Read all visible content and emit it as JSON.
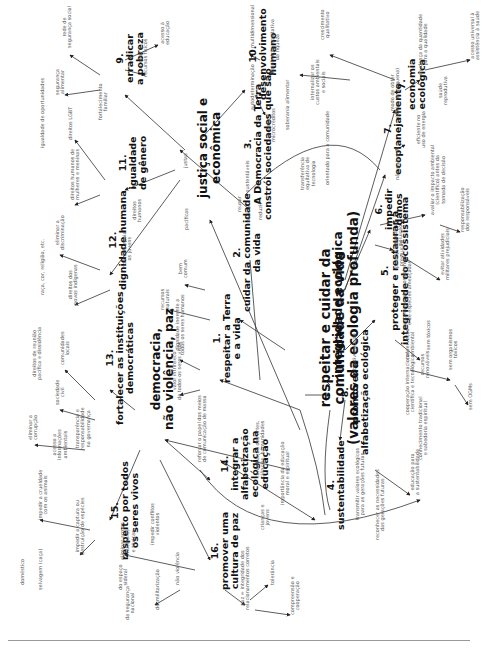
{
  "diagram": {
    "orientation": "rotated -90deg (text reads bottom-to-top)",
    "center": {
      "label": "respeitar e cuidar da\ncomunidade da vida\n(valores da ecologia profunda)",
      "x": 318,
      "y": 445
    },
    "pillars": [
      {
        "id": "p1",
        "label": "integridade ecológica",
        "x": 332,
        "y": 378
      },
      {
        "id": "p2",
        "label": "justiça social e\neconômica",
        "x": 197,
        "y": 198
      },
      {
        "id": "p3",
        "label": "democracia,\nnão violência, paz",
        "x": 150,
        "y": 430
      }
    ],
    "principles": [
      {
        "id": "1",
        "label": "1.\nrespeitar a Terra\ne a vida",
        "x": 212,
        "y": 383
      },
      {
        "id": "2",
        "label": "2.\ncuidar da comunidade\nda vida",
        "x": 232,
        "y": 312
      },
      {
        "id": "3",
        "label": "3.\nA Democracia da Terra\nconstrói sociedades que são",
        "x": 243,
        "y": 220
      },
      {
        "id": "4",
        "label": "4.\nsustentabilidade",
        "x": 326,
        "y": 530
      },
      {
        "id": "5",
        "label": "5.\nproteger e restaurar a\nintegridade do ecossistema",
        "x": 380,
        "y": 345
      },
      {
        "id": "6",
        "label": "6.\nimpedir\ndanos",
        "x": 374,
        "y": 230
      },
      {
        "id": "7a",
        "label": "7.\necoplanejamento",
        "x": 383,
        "y": 175
      },
      {
        "id": "7b",
        "label": "7.\neconomia\necológica",
        "x": 397,
        "y": 110
      },
      {
        "id": "8",
        "label": "8.\npromover a\nalfabetização ecológica",
        "x": 340,
        "y": 455
      },
      {
        "id": "9",
        "label": "9.\nerradicar\na pobreza",
        "x": 115,
        "y": 85
      },
      {
        "id": "10",
        "label": "10.\ndesenvolvimento\nhumano",
        "x": 248,
        "y": 100
      },
      {
        "id": "11",
        "label": "11.\nigualdade\nde gênero",
        "x": 118,
        "y": 190
      },
      {
        "id": "12",
        "label": "12.\ndignidade humana",
        "x": 108,
        "y": 290
      },
      {
        "id": "13",
        "label": "13.\nfortalecer as instituições\ndemocráticas",
        "x": 105,
        "y": 425
      },
      {
        "id": "14",
        "label": "14.\nintegrar a\nalfabetização\necológica na\neducação",
        "x": 220,
        "y": 500
      },
      {
        "id": "15",
        "label": "15.\nrespeito por todos\nos seres vivos",
        "x": 110,
        "y": 560
      },
      {
        "id": "16",
        "label": "16.\npromover uma\ncultura de paz",
        "x": 210,
        "y": 590
      }
    ],
    "leaves": [
      {
        "label": "bem\ncomum",
        "x": 178,
        "y": 278
      },
      {
        "label": "recursos\nnaturais",
        "x": 160,
        "y": 310
      },
      {
        "label": "dignidade inerente a\ntodos os seres humanos",
        "x": 175,
        "y": 355
      },
      {
        "label": "valor intrínseco\nde todos os seres vivos",
        "x": 172,
        "y": 400
      },
      {
        "label": "justas",
        "x": 183,
        "y": 168
      },
      {
        "label": "pacíficas",
        "x": 184,
        "y": 230
      },
      {
        "label": "sustentáveis",
        "x": 245,
        "y": 192
      },
      {
        "label": "reusar",
        "x": 237,
        "y": 212
      },
      {
        "label": "reciclar",
        "x": 246,
        "y": 222
      },
      {
        "label": "reduzir",
        "x": 258,
        "y": 220
      },
      {
        "label": "rede de\nsegurança social",
        "x": 62,
        "y": 48
      },
      {
        "label": "segurança\nalimentar",
        "x": 55,
        "y": 95
      },
      {
        "label": "acesso a\nrecursos físicos",
        "x": 138,
        "y": 77
      },
      {
        "label": "acesso à\neducação",
        "x": 160,
        "y": 45
      },
      {
        "label": "multidimensional",
        "x": 250,
        "y": 48
      },
      {
        "label": "autodeterminação",
        "x": 250,
        "y": 110
      },
      {
        "label": "acesso e\nmicrocréditos",
        "x": 266,
        "y": 142
      },
      {
        "label": "soberania alimentar",
        "x": 285,
        "y": 130
      },
      {
        "label": "distribuição equitativa\nda riqueza",
        "x": 270,
        "y": 75
      },
      {
        "label": "crescimento\nqualitativo",
        "x": 320,
        "y": 40
      },
      {
        "label": "internalizar os\ncustos ambientais\ne sociais",
        "x": 310,
        "y": 105
      },
      {
        "label": "transferência\nequitativa de\ntecnologia",
        "x": 300,
        "y": 190
      },
      {
        "label": "orientado para a comunidade",
        "x": 325,
        "y": 185
      },
      {
        "label": "modo de obter\n(meios de pequena)",
        "x": 390,
        "y": 118
      },
      {
        "label": "eficiente no\nuso de energia",
        "x": 416,
        "y": 148
      },
      {
        "label": "não-poluente",
        "x": 395,
        "y": 180
      },
      {
        "label": "mudança da quantidade\npara a qualidade",
        "x": 418,
        "y": 75
      },
      {
        "label": "saúde\nreprodutiva",
        "x": 438,
        "y": 105
      },
      {
        "label": "acesso universal à\nassistência à saúde",
        "x": 470,
        "y": 60
      },
      {
        "label": "avaliar o impacto ambiental\n(cientifico) antes da\ntomada de decisão",
        "x": 430,
        "y": 215
      },
      {
        "label": "responsabilização\ndos responsáveis",
        "x": 460,
        "y": 232
      },
      {
        "label": "impedir a\npoluição",
        "x": 393,
        "y": 247
      },
      {
        "label": "princípio da\nprecaução",
        "x": 394,
        "y": 268
      },
      {
        "label": "evitar atividades\nmilitares prejudiciais",
        "x": 440,
        "y": 280
      },
      {
        "label": "recuperação de ecossistemas\ne de espécies ameaçadas",
        "x": 402,
        "y": 330
      },
      {
        "label": "conservação\nambiental",
        "x": 405,
        "y": 360
      },
      {
        "label": "sem tóxicos",
        "x": 426,
        "y": 350
      },
      {
        "label": "recursos\nrenováveis",
        "x": 420,
        "y": 378
      },
      {
        "label": "sem organismos\ntóxicos",
        "x": 448,
        "y": 370
      },
      {
        "label": "sem OGMs",
        "x": 468,
        "y": 410
      },
      {
        "label": "biodiversidade",
        "x": 352,
        "y": 370
      },
      {
        "label": "cooperação internacional\ncientífica e tecnológica",
        "x": 405,
        "y": 415
      },
      {
        "label": "conhecimento tradicional\ne sabedoria espiritual",
        "x": 418,
        "y": 460
      },
      {
        "label": "educação para\na sustentabilidade",
        "x": 410,
        "y": 495
      },
      {
        "label": "transmitir valores ecológicos\npara as gerações futuras",
        "x": 355,
        "y": 520
      },
      {
        "label": "reconhecer as necessidades\ndas gerações futuras",
        "x": 375,
        "y": 540
      },
      {
        "label": "igualdade de oportunidades",
        "x": 40,
        "y": 148
      },
      {
        "label": "direitos LGBT",
        "x": 68,
        "y": 140
      },
      {
        "label": "fortalecimento\nfamiliar",
        "x": 98,
        "y": 120
      },
      {
        "label": "direitos humanos de\nmulheres e meninas",
        "x": 70,
        "y": 200
      },
      {
        "label": "direitos\nhumanos",
        "x": 132,
        "y": 222
      },
      {
        "label": "eliminar a\ndiscriminação",
        "x": 55,
        "y": 250
      },
      {
        "label": "raça, cor, religião, etc.",
        "x": 40,
        "y": 295
      },
      {
        "label": "honrar e apoiar\nos jovens",
        "x": 122,
        "y": 268
      },
      {
        "label": "direitos dos\npovos indígenas",
        "x": 68,
        "y": 305
      },
      {
        "label": "direitos de reunião\npacífica e dissidência",
        "x": 32,
        "y": 380
      },
      {
        "label": "comunidades\nlocais",
        "x": 60,
        "y": 365
      },
      {
        "label": "sociedade\ncivil",
        "x": 55,
        "y": 405
      },
      {
        "label": "transparência e\nresponsabilidade\nna governança",
        "x": 75,
        "y": 450
      },
      {
        "label": "eliminar a\ncorrupção",
        "x": 28,
        "y": 440
      },
      {
        "label": "acesso a\ninformações\nambientais",
        "x": 52,
        "y": 460
      },
      {
        "label": "reforçar o papel dos meios\nde comunicação de massa",
        "x": 197,
        "y": 462
      },
      {
        "label": "contribuição das artes,\nciências, humanidades",
        "x": 255,
        "y": 478
      },
      {
        "label": "importância da educação\nmoral e espiritual",
        "x": 280,
        "y": 505
      },
      {
        "label": "crianças e\njovens",
        "x": 260,
        "y": 530
      },
      {
        "label": "impedir a crueldade\ncom os animais",
        "x": 38,
        "y": 520
      },
      {
        "label": "doméstico",
        "x": 20,
        "y": 585
      },
      {
        "label": "selvagem (caça)",
        "x": 38,
        "y": 590
      },
      {
        "label": "impedir a captura ou\ndestruição de espécies",
        "x": 75,
        "y": 555
      },
      {
        "label": "eliminar armas\nnucleares\ne tóxicas",
        "x": 120,
        "y": 560
      },
      {
        "label": "impedir conflitos\nviolentos",
        "x": 150,
        "y": 545
      },
      {
        "label": "não violência",
        "x": 175,
        "y": 585
      },
      {
        "label": "desmilitarização",
        "x": 155,
        "y": 610
      },
      {
        "label": "do espaço\nsideral",
        "x": 118,
        "y": 590
      },
      {
        "label": "da segurança\nnacional",
        "x": 125,
        "y": 620
      },
      {
        "label": "paz = integridade dos\nrelacionamentos corretos",
        "x": 240,
        "y": 610
      },
      {
        "label": "tolerância",
        "x": 270,
        "y": 585
      },
      {
        "label": "compreensão e\ncooperação",
        "x": 290,
        "y": 615
      }
    ]
  }
}
